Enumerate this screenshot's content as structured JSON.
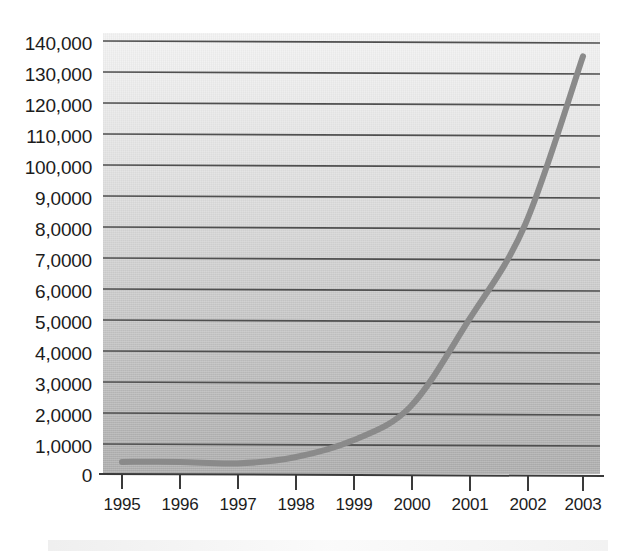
{
  "chart_data": {
    "type": "line",
    "title": "",
    "subtitle": "",
    "xlabel": "",
    "ylabel": "",
    "x": [
      1995,
      1996,
      1997,
      1998,
      1999,
      2000,
      2001,
      2002,
      2003
    ],
    "categories": [
      "1995",
      "1996",
      "1997",
      "1998",
      "1999",
      "2000",
      "2001",
      "2002",
      "2003"
    ],
    "values": [
      2000,
      2000,
      1500,
      3500,
      9000,
      20000,
      48000,
      80000,
      135000
    ],
    "series": [
      {
        "name": "",
        "values": [
          2000,
          2000,
          1500,
          3500,
          9000,
          20000,
          48000,
          80000,
          135000
        ]
      }
    ],
    "ylim": [
      0,
      140000
    ],
    "xlim": [
      1995,
      2003
    ],
    "y_tick_values": [
      0,
      10000,
      20000,
      30000,
      40000,
      50000,
      60000,
      70000,
      80000,
      90000,
      100000,
      110000,
      120000,
      130000,
      140000
    ],
    "y_tick_labels": [
      "0",
      "1,0000",
      "2,0000",
      "3,0000",
      "4,0000",
      "5,0000",
      "6,0000",
      "7,0000",
      "8,0000",
      "9,0000",
      "100,000",
      "110,000",
      "120,000",
      "130,000",
      "140,000"
    ],
    "x_tick_labels": [
      "1995",
      "1996",
      "1997",
      "1998",
      "1999",
      "2000",
      "2001",
      "2002",
      "2003"
    ],
    "grid": true,
    "grid_axis": "y",
    "legend": false,
    "legend_position": "none",
    "annotations": [],
    "colors": {
      "line": "#8a8a8a",
      "grid": "#4f4f4f",
      "axis": "#3a3a3a",
      "text": "#1c1c1c",
      "plot_background_top": "#f2f2f2",
      "plot_background_bottom": "#adadad",
      "page_background": "#ffffff"
    },
    "line_width_px": 6
  }
}
